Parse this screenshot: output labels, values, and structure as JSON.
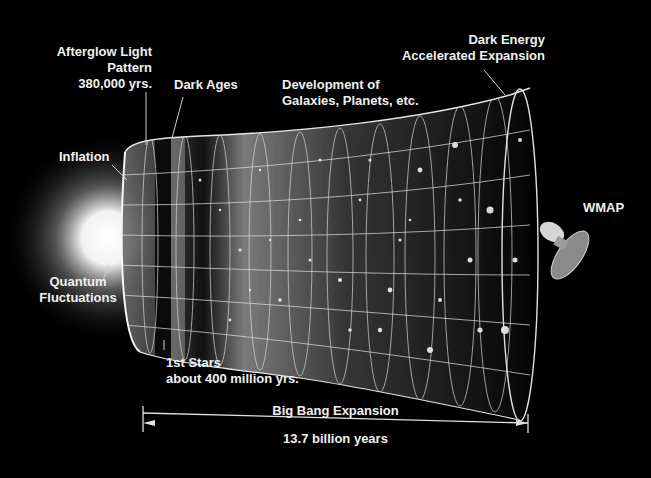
{
  "diagram": {
    "labels": {
      "afterglow": [
        "Afterglow Light",
        "Pattern",
        "380,000 yrs."
      ],
      "dark_ages": [
        "Dark Ages"
      ],
      "development": [
        "Development of",
        "Galaxies, Planets, etc."
      ],
      "dark_energy": [
        "Dark Energy",
        "Accelerated Expansion"
      ],
      "inflation": [
        "Inflation"
      ],
      "quantum": [
        "Quantum",
        "Fluctuations"
      ],
      "wmap": [
        "WMAP"
      ],
      "first_stars": [
        "1st Stars",
        "about 400 million yrs."
      ]
    },
    "timeline": {
      "top_label": "Big Bang Expansion",
      "bottom_label": "13.7 billion years"
    },
    "colors": {
      "background": "#000000",
      "text": "#f0f0f0",
      "grid": "#d8d8d8",
      "glow": "#ffffff"
    }
  }
}
